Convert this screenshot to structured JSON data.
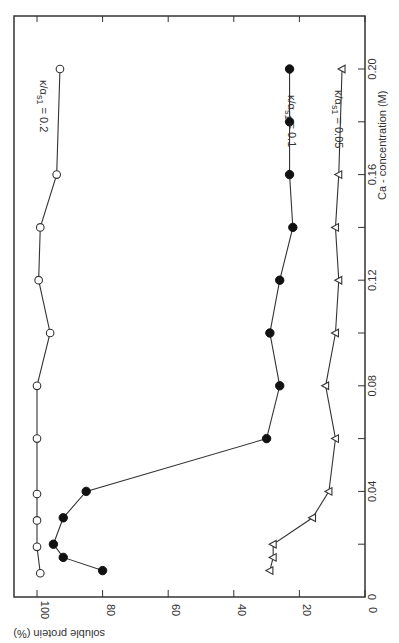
{
  "chart_data": {
    "type": "line",
    "orientation": "rotated-90-clockwise",
    "title": "",
    "xlabel": "Ca - concentration (M)",
    "ylabel": "soluble protein (%)",
    "xlim": [
      0,
      0.22
    ],
    "ylim": [
      0,
      105
    ],
    "x_ticks": [
      "0",
      "0.04",
      "0.08",
      "0.12",
      "0.16",
      "0.20"
    ],
    "x_tick_values": [
      0,
      0.04,
      0.08,
      0.12,
      0.16,
      0.2
    ],
    "y_ticks": [
      "0",
      "20",
      "40",
      "60",
      "80",
      "100"
    ],
    "y_tick_values": [
      0,
      20,
      40,
      60,
      80,
      100
    ],
    "grid": false,
    "series": [
      {
        "name": "κ/αs1 = 0.2",
        "label": "κ/α",
        "label_sub": "s1",
        "label_value": " = 0.2",
        "marker": "open-circle",
        "x": [
          0.009,
          0.019,
          0.029,
          0.039,
          0.06,
          0.08,
          0.1,
          0.12,
          0.14,
          0.16,
          0.2
        ],
        "values": [
          99,
          100,
          100,
          100,
          100,
          100,
          96,
          99.5,
          99,
          94,
          93
        ]
      },
      {
        "name": "κ/αs1 = 0.1",
        "label": "κ/α",
        "label_sub": "s1",
        "label_value": " = 0.1",
        "marker": "filled-circle",
        "x": [
          0.01,
          0.015,
          0.02,
          0.03,
          0.04,
          0.06,
          0.08,
          0.1,
          0.12,
          0.14,
          0.16,
          0.18,
          0.2
        ],
        "values": [
          80,
          92,
          95,
          92,
          85,
          30,
          26,
          29,
          26,
          22,
          23,
          23,
          23
        ]
      },
      {
        "name": "κ/αs1 = 0.05",
        "label": "κ/α",
        "label_sub": "s1",
        "label_value": " = 0.05",
        "marker": "open-triangle",
        "x": [
          0.01,
          0.015,
          0.02,
          0.03,
          0.04,
          0.06,
          0.08,
          0.1,
          0.12,
          0.14,
          0.16,
          0.2
        ],
        "values": [
          29,
          28,
          28,
          16,
          11,
          9,
          12,
          9,
          8,
          9,
          8,
          7
        ]
      }
    ]
  },
  "axis_labels": {
    "x": "Ca - concentration (M)",
    "y": "soluble protein (%)"
  },
  "colors": {
    "line": "#333333",
    "background": "#ffffff"
  }
}
